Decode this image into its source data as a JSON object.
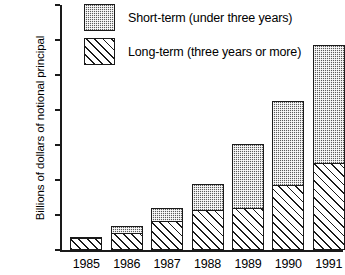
{
  "chart_data": {
    "type": "bar",
    "subtype": "stacked-vertical",
    "title": "",
    "xlabel": "",
    "ylabel": "Billions of dollars of notional principal",
    "categories": [
      "1985",
      "1986",
      "1987",
      "1988",
      "1989",
      "1990",
      "1991"
    ],
    "ylim": [
      0,
      3500
    ],
    "yticks": [
      0,
      500,
      1000,
      1500,
      2000,
      2500,
      3000,
      3500
    ],
    "ytick_labels": [
      "0",
      "500",
      "1000",
      "1500",
      "2000",
      "2500",
      "3000",
      "3500"
    ],
    "grid": false,
    "legend_position": "top-left-inside",
    "series": [
      {
        "name": "Long-term (three years or more)",
        "fill": "diagonal-hatch",
        "color": "#ffffff",
        "values": [
          170,
          240,
          415,
          570,
          600,
          930,
          1250
        ]
      },
      {
        "name": "Short-term (under three years)",
        "fill": "dark-stipple",
        "color": "#5b5b5b",
        "values": [
          30,
          125,
          200,
          390,
          930,
          1210,
          1700
        ]
      }
    ],
    "totals": [
      200,
      365,
      615,
      960,
      1530,
      2140,
      2950
    ]
  },
  "legend": {
    "items": [
      {
        "label": "Short-term (under three years)"
      },
      {
        "label": "Long-term (three years or more)"
      }
    ]
  }
}
